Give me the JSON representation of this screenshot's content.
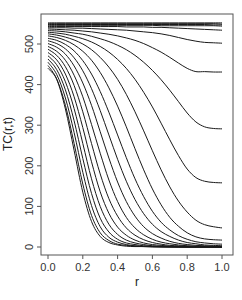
{
  "chart_data": {
    "type": "line",
    "title": "",
    "xlabel": "r",
    "ylabel": "TC(r,t)",
    "xlim": [
      0.0,
      1.0
    ],
    "ylim": [
      -20,
      560
    ],
    "xticks": [
      0.0,
      0.2,
      0.4,
      0.6,
      0.8,
      1.0
    ],
    "xtick_labels": [
      "0.0",
      "0.2",
      "0.4",
      "0.6",
      "0.8",
      "1.0"
    ],
    "yticks": [
      0,
      100,
      200,
      300,
      400,
      500
    ],
    "ytick_labels": [
      "0",
      "100",
      "200",
      "300",
      "400",
      "500"
    ],
    "grid": false,
    "legend": null,
    "line_color": "#1a1a1a",
    "x": [
      0.0,
      0.05,
      0.1,
      0.15,
      0.2,
      0.25,
      0.3,
      0.35,
      0.4,
      0.45,
      0.5,
      0.55,
      0.6,
      0.65,
      0.7,
      0.75,
      0.8,
      0.85,
      0.9,
      0.95,
      1.0
    ],
    "series_note": "Family of curves for increasing t; each decays in r. Top bundle stays ~540-550.",
    "series": [
      {
        "name": "t1",
        "values": [
          552,
          552,
          552,
          552,
          552,
          552,
          552,
          552,
          552,
          552,
          552,
          552,
          552,
          552,
          552,
          552,
          552,
          552,
          552,
          552,
          552
        ]
      },
      {
        "name": "t2",
        "values": [
          550,
          550,
          550,
          550,
          550,
          550,
          550,
          550,
          550,
          550,
          550,
          550,
          550,
          550,
          550,
          550,
          550,
          550,
          550,
          550,
          549
        ]
      },
      {
        "name": "t3",
        "values": [
          548,
          548,
          548,
          548,
          548,
          548,
          548,
          548,
          548,
          548,
          548,
          548,
          548,
          548,
          548,
          548,
          548,
          548,
          548,
          547,
          547
        ]
      },
      {
        "name": "t4",
        "values": [
          546,
          546,
          546,
          546,
          546,
          546,
          546,
          546,
          546,
          546,
          546,
          546,
          546,
          545,
          545,
          545,
          545,
          545,
          545,
          545,
          544
        ]
      },
      {
        "name": "t5",
        "values": [
          543,
          543,
          543,
          543,
          543,
          543,
          543,
          543,
          543,
          542,
          542,
          542,
          541,
          541,
          540,
          539,
          538,
          537,
          536,
          535,
          534
        ]
      },
      {
        "name": "t6",
        "values": [
          540,
          540,
          540,
          539,
          539,
          538,
          537,
          536,
          535,
          534,
          532,
          530,
          528,
          525,
          521,
          516,
          511,
          507,
          504,
          503,
          502
        ]
      },
      {
        "name": "t7",
        "values": [
          537,
          536,
          535,
          534,
          532,
          530,
          527,
          524,
          520,
          515,
          509,
          501,
          491,
          480,
          467,
          453,
          440,
          432,
          432,
          431,
          431
        ]
      },
      {
        "name": "t8",
        "values": [
          533,
          532,
          530,
          527,
          524,
          519,
          513,
          506,
          497,
          486,
          472,
          455,
          435,
          412,
          386,
          358,
          330,
          308,
          296,
          292,
          291
        ]
      },
      {
        "name": "t9",
        "values": [
          529,
          527,
          524,
          519,
          513,
          505,
          494,
          480,
          462,
          440,
          413,
          381,
          345,
          305,
          264,
          225,
          192,
          171,
          162,
          159,
          158
        ]
      },
      {
        "name": "t10",
        "values": [
          525,
          522,
          517,
          510,
          500,
          486,
          467,
          443,
          413,
          376,
          333,
          286,
          237,
          190,
          148,
          113,
          86,
          66,
          55,
          50,
          47
        ]
      },
      {
        "name": "t11",
        "values": [
          520,
          516,
          509,
          498,
          482,
          460,
          430,
          392,
          347,
          296,
          242,
          190,
          143,
          104,
          73,
          51,
          35,
          25,
          20,
          18,
          17
        ]
      },
      {
        "name": "t12",
        "values": [
          514,
          509,
          499,
          483,
          459,
          426,
          383,
          332,
          276,
          220,
          168,
          124,
          88,
          61,
          42,
          28,
          19,
          13,
          10,
          8,
          7
        ]
      },
      {
        "name": "t13",
        "values": [
          508,
          501,
          488,
          466,
          434,
          390,
          336,
          276,
          216,
          162,
          117,
          82,
          56,
          38,
          26,
          17,
          11,
          8,
          5,
          4,
          3
        ]
      },
      {
        "name": "t14",
        "values": [
          501,
          492,
          475,
          446,
          404,
          349,
          284,
          219,
          160,
          112,
          76,
          50,
          33,
          22,
          14,
          9,
          6,
          4,
          3,
          2,
          2
        ]
      },
      {
        "name": "t15",
        "values": [
          494,
          482,
          460,
          423,
          370,
          302,
          231,
          165,
          112,
          73,
          47,
          30,
          19,
          12,
          8,
          5,
          3,
          2,
          1,
          1,
          1
        ]
      },
      {
        "name": "t16",
        "values": [
          487,
          472,
          444,
          398,
          333,
          255,
          180,
          119,
          76,
          47,
          29,
          18,
          11,
          7,
          4,
          3,
          2,
          1,
          1,
          0,
          0
        ]
      },
      {
        "name": "t17",
        "values": [
          479,
          461,
          426,
          370,
          294,
          210,
          136,
          83,
          49,
          29,
          17,
          10,
          6,
          4,
          2,
          1,
          1,
          0,
          0,
          0,
          0
        ]
      },
      {
        "name": "t18",
        "values": [
          471,
          449,
          407,
          341,
          255,
          168,
          100,
          56,
          31,
          17,
          10,
          6,
          3,
          2,
          1,
          1,
          0,
          0,
          0,
          0,
          0
        ]
      },
      {
        "name": "t19",
        "values": [
          463,
          437,
          387,
          311,
          218,
          132,
          71,
          37,
          19,
          10,
          6,
          3,
          2,
          1,
          1,
          0,
          0,
          0,
          0,
          0,
          0
        ]
      },
      {
        "name": "t20",
        "values": [
          455,
          425,
          367,
          282,
          184,
          102,
          50,
          24,
          12,
          6,
          3,
          2,
          1,
          1,
          0,
          0,
          0,
          0,
          0,
          0,
          0
        ]
      },
      {
        "name": "t21",
        "values": [
          447,
          414,
          349,
          255,
          155,
          78,
          35,
          16,
          7,
          4,
          2,
          1,
          1,
          0,
          0,
          0,
          0,
          0,
          0,
          0,
          0
        ]
      },
      {
        "name": "t22",
        "values": [
          440,
          413,
          340,
          238,
          135,
          63,
          26,
          11,
          5,
          2,
          1,
          1,
          0,
          0,
          0,
          0,
          0,
          0,
          0,
          0,
          0
        ]
      }
    ]
  }
}
